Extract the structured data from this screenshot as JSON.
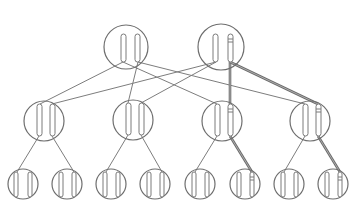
{
  "diagram": {
    "colors": {
      "background": "#ffffff",
      "stroke": "#6e6e6e",
      "highlight": "#6a6a6a"
    },
    "nodes": [
      {
        "id": "t1",
        "level": 0,
        "cx": 126,
        "cy": 47,
        "r": 22,
        "bars": [
          {
            "x": 121,
            "y": 34,
            "w": 5,
            "h": 28
          },
          {
            "x": 135,
            "y": 34,
            "w": 5,
            "h": 28
          }
        ],
        "marked_bar": null
      },
      {
        "id": "t2",
        "level": 0,
        "cx": 221,
        "cy": 47,
        "r": 23,
        "bars": [
          {
            "x": 213,
            "y": 34,
            "w": 5,
            "h": 28
          },
          {
            "x": 228,
            "y": 34,
            "w": 5,
            "h": 28
          }
        ],
        "marked_bar": 1
      },
      {
        "id": "m1",
        "level": 1,
        "cx": 44,
        "cy": 121,
        "r": 20,
        "bars": [
          {
            "x": 37,
            "y": 104,
            "w": 5,
            "h": 32
          },
          {
            "x": 50,
            "y": 104,
            "w": 5,
            "h": 32
          }
        ],
        "marked_bar": null
      },
      {
        "id": "m2",
        "level": 1,
        "cx": 133,
        "cy": 120,
        "r": 20,
        "bars": [
          {
            "x": 126,
            "y": 103,
            "w": 5,
            "h": 32
          },
          {
            "x": 139,
            "y": 103,
            "w": 5,
            "h": 32
          }
        ],
        "marked_bar": null
      },
      {
        "id": "m3",
        "level": 1,
        "cx": 222,
        "cy": 121,
        "r": 20,
        "bars": [
          {
            "x": 215,
            "y": 104,
            "w": 5,
            "h": 32
          },
          {
            "x": 228,
            "y": 104,
            "w": 5,
            "h": 32
          }
        ],
        "marked_bar": 1
      },
      {
        "id": "m4",
        "level": 1,
        "cx": 310,
        "cy": 121,
        "r": 20,
        "bars": [
          {
            "x": 303,
            "y": 104,
            "w": 5,
            "h": 32
          },
          {
            "x": 316,
            "y": 104,
            "w": 5,
            "h": 32
          }
        ],
        "marked_bar": 1
      },
      {
        "id": "l1",
        "level": 2,
        "cx": 23,
        "cy": 184,
        "r": 15,
        "bars": [
          {
            "x": 14,
            "y": 172,
            "w": 4,
            "h": 25
          },
          {
            "x": 28,
            "y": 172,
            "w": 4,
            "h": 25
          }
        ],
        "marked_bar": null
      },
      {
        "id": "l2",
        "level": 2,
        "cx": 67,
        "cy": 184,
        "r": 15,
        "bars": [
          {
            "x": 59,
            "y": 172,
            "w": 4,
            "h": 25
          },
          {
            "x": 72,
            "y": 172,
            "w": 4,
            "h": 25
          }
        ],
        "marked_bar": null
      },
      {
        "id": "l3",
        "level": 2,
        "cx": 111,
        "cy": 184,
        "r": 15,
        "bars": [
          {
            "x": 103,
            "y": 172,
            "w": 4,
            "h": 25
          },
          {
            "x": 116,
            "y": 172,
            "w": 4,
            "h": 25
          }
        ],
        "marked_bar": null
      },
      {
        "id": "l4",
        "level": 2,
        "cx": 155,
        "cy": 184,
        "r": 15,
        "bars": [
          {
            "x": 147,
            "y": 172,
            "w": 4,
            "h": 25
          },
          {
            "x": 160,
            "y": 172,
            "w": 4,
            "h": 25
          }
        ],
        "marked_bar": null
      },
      {
        "id": "l5",
        "level": 2,
        "cx": 200,
        "cy": 184,
        "r": 15,
        "bars": [
          {
            "x": 192,
            "y": 172,
            "w": 4,
            "h": 25
          },
          {
            "x": 205,
            "y": 172,
            "w": 4,
            "h": 25
          }
        ],
        "marked_bar": null
      },
      {
        "id": "l6",
        "level": 2,
        "cx": 245,
        "cy": 184,
        "r": 15,
        "bars": [
          {
            "x": 237,
            "y": 172,
            "w": 4,
            "h": 25
          },
          {
            "x": 250,
            "y": 172,
            "w": 4,
            "h": 25
          }
        ],
        "marked_bar": 1
      },
      {
        "id": "l7",
        "level": 2,
        "cx": 289,
        "cy": 184,
        "r": 15,
        "bars": [
          {
            "x": 281,
            "y": 172,
            "w": 4,
            "h": 25
          },
          {
            "x": 294,
            "y": 172,
            "w": 4,
            "h": 25
          }
        ],
        "marked_bar": null
      },
      {
        "id": "l8",
        "level": 2,
        "cx": 333,
        "cy": 184,
        "r": 15,
        "bars": [
          {
            "x": 325,
            "y": 172,
            "w": 4,
            "h": 25
          },
          {
            "x": 338,
            "y": 172,
            "w": 4,
            "h": 25
          }
        ],
        "marked_bar": 1
      }
    ],
    "edges": [
      {
        "from": "t1",
        "x1": 123,
        "y1": 62,
        "x2": 40,
        "y2": 104,
        "highlight": false
      },
      {
        "from": "t1",
        "x1": 123,
        "y1": 62,
        "x2": 217,
        "y2": 104,
        "highlight": false
      },
      {
        "from": "t1",
        "x1": 138,
        "y1": 62,
        "x2": 128,
        "y2": 103,
        "highlight": false
      },
      {
        "from": "t1",
        "x1": 138,
        "y1": 62,
        "x2": 305,
        "y2": 104,
        "highlight": false
      },
      {
        "from": "t2",
        "x1": 216,
        "y1": 62,
        "x2": 52,
        "y2": 104,
        "highlight": false
      },
      {
        "from": "t2",
        "x1": 216,
        "y1": 62,
        "x2": 141,
        "y2": 103,
        "highlight": false
      },
      {
        "from": "t2",
        "x1": 230,
        "y1": 62,
        "x2": 230,
        "y2": 104,
        "highlight": true
      },
      {
        "from": "t2",
        "x1": 230,
        "y1": 62,
        "x2": 318,
        "y2": 104,
        "highlight": true
      },
      {
        "from": "m1",
        "x1": 39,
        "y1": 136,
        "x2": 17,
        "y2": 172,
        "highlight": false
      },
      {
        "from": "m1",
        "x1": 52,
        "y1": 136,
        "x2": 74,
        "y2": 172,
        "highlight": false
      },
      {
        "from": "m2",
        "x1": 128,
        "y1": 135,
        "x2": 106,
        "y2": 172,
        "highlight": false
      },
      {
        "from": "m2",
        "x1": 141,
        "y1": 135,
        "x2": 162,
        "y2": 172,
        "highlight": false
      },
      {
        "from": "m3",
        "x1": 217,
        "y1": 136,
        "x2": 195,
        "y2": 172,
        "highlight": false
      },
      {
        "from": "m3",
        "x1": 230,
        "y1": 136,
        "x2": 252,
        "y2": 172,
        "highlight": true
      },
      {
        "from": "m4",
        "x1": 305,
        "y1": 136,
        "x2": 284,
        "y2": 172,
        "highlight": false
      },
      {
        "from": "m4",
        "x1": 318,
        "y1": 136,
        "x2": 340,
        "y2": 172,
        "highlight": true
      }
    ]
  }
}
